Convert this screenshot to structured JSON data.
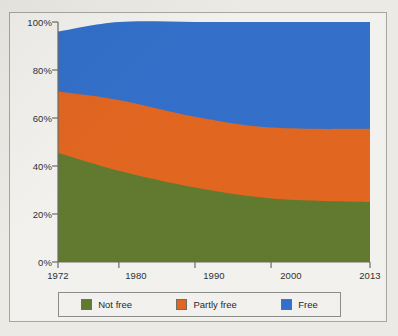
{
  "chart_data": {
    "type": "area",
    "stacked": true,
    "title": "",
    "xlabel": "",
    "ylabel": "",
    "x": [
      1972,
      1980,
      1990,
      2000,
      2013
    ],
    "tick_labels_x": [
      "1972",
      "1980",
      "1990",
      "2000",
      "2013"
    ],
    "tick_labels_y": [
      "0%",
      "20%",
      "40%",
      "60%",
      "80%",
      "100%"
    ],
    "xlim": [
      1972,
      2013
    ],
    "ylim": [
      0,
      100
    ],
    "yticks": [
      0,
      20,
      40,
      60,
      80,
      100
    ],
    "grid": false,
    "legend_position": "bottom",
    "series": [
      {
        "name": "Not free",
        "color": "#5f7a2a",
        "values": [
          45.5,
          38.0,
          31.0,
          26.5,
          25.0
        ]
      },
      {
        "name": "Partly free",
        "color": "#e8651b",
        "values": [
          25.5,
          29.5,
          29.5,
          29.5,
          30.5
        ]
      },
      {
        "name": "Free",
        "color": "#2e6fd0",
        "values": [
          25.0,
          32.5,
          39.5,
          44.0,
          44.5
        ]
      }
    ],
    "series_totals": [
      96.0,
      100.0,
      100.0,
      100.0,
      100.0
    ]
  },
  "axis": {
    "y_ticks": [
      {
        "label": "100%",
        "value": 100
      },
      {
        "label": "80%",
        "value": 80
      },
      {
        "label": "60%",
        "value": 60
      },
      {
        "label": "40%",
        "value": 40
      },
      {
        "label": "20%",
        "value": 20
      },
      {
        "label": "0%",
        "value": 0
      }
    ],
    "x_ticks": [
      {
        "label": "1972",
        "value": 1972
      },
      {
        "label": "1980",
        "value": 1980
      },
      {
        "label": "1990",
        "value": 1990
      },
      {
        "label": "2000",
        "value": 2000
      },
      {
        "label": "2013",
        "value": 2013
      }
    ]
  },
  "legend": {
    "items": [
      {
        "label": "Not free",
        "color": "#5f7a2a"
      },
      {
        "label": "Partly free",
        "color": "#e8651b"
      },
      {
        "label": "Free",
        "color": "#2e6fd0"
      }
    ]
  }
}
